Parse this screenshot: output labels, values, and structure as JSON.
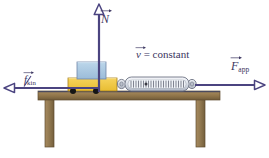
{
  "figure": {
    "type": "physics-free-body-diagram",
    "background_color": "#ffffff"
  },
  "labels": {
    "normal_force": {
      "symbol": "N",
      "subscript": "",
      "full_text": "N",
      "description": "normal-force-vector-label",
      "color": "#3b3560"
    },
    "kinetic_friction": {
      "symbol": "f",
      "subscript": "kin",
      "full_text": "f kin",
      "description": "kinetic-friction-vector-label",
      "color": "#3b3560"
    },
    "applied_force": {
      "symbol": "F",
      "subscript": "app",
      "full_text": "F app",
      "description": "applied-force-vector-label",
      "color": "#3b3560"
    },
    "velocity": {
      "symbol": "v",
      "equals": " = constant",
      "full_text": "v = constant",
      "description": "constant-velocity-annotation",
      "color": "#3b3560"
    }
  },
  "vectors": {
    "normal": {
      "name": "N",
      "direction": "up",
      "x": 99,
      "y_tail": 92,
      "y_head": 6,
      "color": "#4b4480"
    },
    "friction": {
      "name": "f_kin",
      "direction": "left",
      "y": 88,
      "x_tail": 100,
      "x_head": 4,
      "color": "#4b4480"
    },
    "applied": {
      "name": "F_app",
      "direction": "right",
      "y": 85,
      "x_tail": 196,
      "x_head": 264,
      "color": "#4b4480"
    }
  },
  "objects": {
    "top_block": {
      "name": "blue-block",
      "fill": "#a9c6e0",
      "stroke": "#6b7fa3",
      "x": 77,
      "y": 62,
      "width": 29,
      "height": 17
    },
    "bottom_block": {
      "name": "yellow-block",
      "fill": "#f0c845",
      "stroke": "#b08a1e",
      "x": 68,
      "y": 78,
      "width": 49,
      "height": 13
    },
    "spring_scale": {
      "name": "spring-scale",
      "body_fill": "#d8dde6",
      "body_stroke": "#6f7585",
      "spring_color": "#6b6f7d",
      "x": 122,
      "y": 77,
      "width": 68,
      "height": 14,
      "tick_count": 22
    },
    "contact_dots": [
      {
        "name": "contact-point-left",
        "x": 73,
        "y": 91,
        "r": 3,
        "color": "#1a1a1a"
      },
      {
        "name": "contact-point-right",
        "x": 96,
        "y": 91,
        "r": 3,
        "color": "#1a1a1a"
      }
    ],
    "table": {
      "name": "wooden-table",
      "top_fill": "#9b7f53",
      "top_shade": "#7d6540",
      "leg_fill": "#9b8159",
      "leg_stroke": "#6d5838",
      "top_x": 38,
      "top_y": 91,
      "top_width": 182,
      "top_height": 9,
      "leg_left_x": 45,
      "leg_right_x": 196,
      "leg_y": 100,
      "leg_width": 9,
      "leg_height": 47
    }
  }
}
